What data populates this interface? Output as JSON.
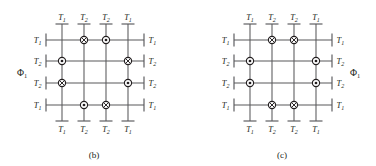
{
  "figure": {
    "panels": [
      {
        "id": "b",
        "caption": "(b)",
        "flux_label": "Φ",
        "flux_sub": "1",
        "flux_side": "left",
        "top_labels": [
          {
            "t": "T",
            "s": "1"
          },
          {
            "t": "T",
            "s": "2"
          },
          {
            "t": "T",
            "s": "2"
          },
          {
            "t": "T",
            "s": "1"
          }
        ],
        "bottom_labels": [
          {
            "t": "T",
            "s": "1"
          },
          {
            "t": "T",
            "s": "2"
          },
          {
            "t": "T",
            "s": "2"
          },
          {
            "t": "T",
            "s": "1"
          }
        ],
        "left_labels": [
          {
            "t": "T",
            "s": "1"
          },
          {
            "t": "T",
            "s": "2"
          },
          {
            "t": "T",
            "s": "2"
          },
          {
            "t": "T",
            "s": "1"
          }
        ],
        "right_labels": [
          {
            "t": "T",
            "s": "1"
          },
          {
            "t": "T",
            "s": "2"
          },
          {
            "t": "T",
            "s": "2"
          },
          {
            "t": "T",
            "s": "1"
          }
        ],
        "junctions": [
          {
            "row": 1,
            "col": 2,
            "type": "cross"
          },
          {
            "row": 1,
            "col": 3,
            "type": "dot"
          },
          {
            "row": 2,
            "col": 1,
            "type": "dot"
          },
          {
            "row": 2,
            "col": 4,
            "type": "cross"
          },
          {
            "row": 3,
            "col": 1,
            "type": "cross"
          },
          {
            "row": 3,
            "col": 4,
            "type": "dot"
          },
          {
            "row": 4,
            "col": 2,
            "type": "dot"
          },
          {
            "row": 4,
            "col": 3,
            "type": "cross"
          }
        ]
      },
      {
        "id": "c",
        "caption": "(c)",
        "flux_label": "Φ",
        "flux_sub": "1",
        "flux_side": "right",
        "top_labels": [
          {
            "t": "T",
            "s": "1"
          },
          {
            "t": "T",
            "s": "2"
          },
          {
            "t": "T",
            "s": "2"
          },
          {
            "t": "T",
            "s": "1"
          }
        ],
        "bottom_labels": [
          {
            "t": "T",
            "s": "1"
          },
          {
            "t": "T",
            "s": "2"
          },
          {
            "t": "T",
            "s": "2"
          },
          {
            "t": "T",
            "s": "1"
          }
        ],
        "left_labels": [
          {
            "t": "T",
            "s": "1"
          },
          {
            "t": "T",
            "s": "2"
          },
          {
            "t": "T",
            "s": "2"
          },
          {
            "t": "T",
            "s": "1"
          }
        ],
        "right_labels": [
          {
            "t": "T",
            "s": "1"
          },
          {
            "t": "T",
            "s": "2"
          },
          {
            "t": "T",
            "s": "2"
          },
          {
            "t": "T",
            "s": "1"
          }
        ],
        "junctions": [
          {
            "row": 1,
            "col": 2,
            "type": "cross"
          },
          {
            "row": 1,
            "col": 3,
            "type": "cross"
          },
          {
            "row": 2,
            "col": 1,
            "type": "dot"
          },
          {
            "row": 2,
            "col": 4,
            "type": "dot"
          },
          {
            "row": 3,
            "col": 1,
            "type": "dot"
          },
          {
            "row": 3,
            "col": 4,
            "type": "dot"
          },
          {
            "row": 4,
            "col": 2,
            "type": "cross"
          },
          {
            "row": 4,
            "col": 3,
            "type": "cross"
          }
        ]
      }
    ],
    "colors": {
      "wire": "#58585b",
      "symbol": "#231f20",
      "background": "#ffffff"
    },
    "geometry": {
      "columns": 4,
      "rows": 4,
      "col_x": [
        62,
        84,
        106,
        128
      ],
      "row_y": [
        40,
        61,
        83,
        105
      ],
      "stub": 16,
      "symbol_radius": 3.6
    }
  }
}
